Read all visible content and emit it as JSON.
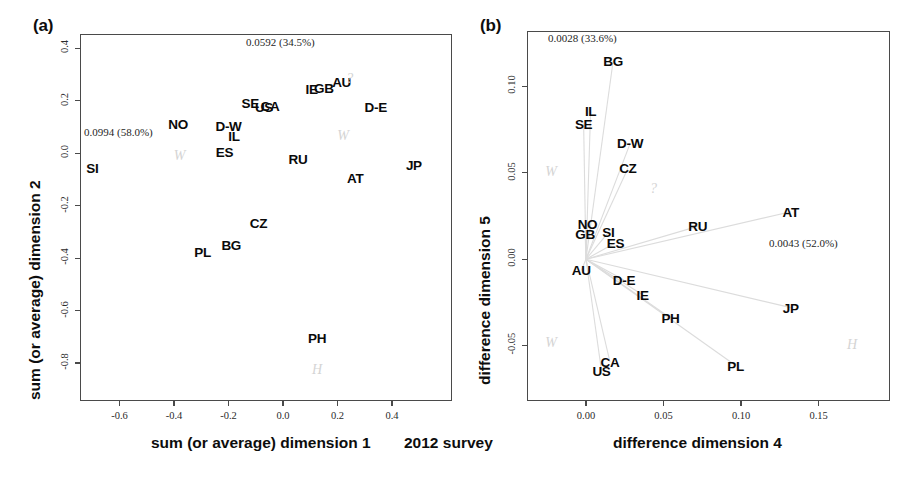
{
  "figure": {
    "survey_label": "2012 survey"
  },
  "panel_a": {
    "tag": "(a)",
    "xlabel": "sum (or average) dimension 1",
    "ylabel": "sum (or average) dimension 2",
    "inertia_x": "0.0994  (58.0%)",
    "inertia_y": "0.0592  (34.5%)",
    "xticks": [
      "-0.6",
      "-0.4",
      "-0.2",
      "0.0",
      "0.2",
      "0.4"
    ],
    "xtick_values": [
      -0.6,
      -0.4,
      -0.2,
      0.0,
      0.2,
      0.4
    ],
    "yticks": [
      "0.4",
      "0.2",
      "0.0",
      "-0.2",
      "-0.4",
      "-0.6",
      "-0.8"
    ],
    "ytick_values": [
      0.4,
      0.2,
      0.0,
      -0.2,
      -0.4,
      -0.6,
      -0.8
    ],
    "watermarks": [
      {
        "text": "W",
        "x": -0.38,
        "y": -0.01
      },
      {
        "text": "?",
        "x": 0.245,
        "y": 0.285
      },
      {
        "text": "W",
        "x": 0.22,
        "y": 0.065
      },
      {
        "text": "H",
        "x": 0.125,
        "y": -0.825
      }
    ]
  },
  "panel_b": {
    "tag": "(b)",
    "xlabel": "difference dimension 4",
    "ylabel": "difference dimension 5",
    "inertia_x": "0.0043  (52.0%)",
    "inertia_y": "0.0028  (33.6%)",
    "xticks": [
      "0.00",
      "0.05",
      "0.10",
      "0.15"
    ],
    "xtick_values": [
      0.0,
      0.05,
      0.1,
      0.15
    ],
    "yticks": [
      "0.10",
      "0.05",
      "0.00",
      "-0.05"
    ],
    "ytick_values": [
      0.1,
      0.05,
      0.0,
      -0.05
    ],
    "watermarks": [
      {
        "text": "W",
        "x": -0.0225,
        "y": 0.0505
      },
      {
        "text": "?",
        "x": 0.0435,
        "y": 0.0405
      },
      {
        "text": "W",
        "x": -0.0225,
        "y": -0.0485
      },
      {
        "text": "H",
        "x": 0.1715,
        "y": -0.0495
      }
    ]
  },
  "chart_data": [
    {
      "type": "scatter",
      "panel": "(a)",
      "title": "sum (or average) dimensions 1 and 2",
      "xlabel": "sum (or average) dimension 1",
      "ylabel": "sum (or average) dimension 2",
      "xlim": [
        -0.745,
        0.62
      ],
      "ylim": [
        -0.945,
        0.455
      ],
      "grid": false,
      "legend": "none",
      "axis_inertia": {
        "dim1_eigenvalue": 0.0994,
        "dim1_percent": 58.0,
        "dim2_eigenvalue": 0.0592,
        "dim2_percent": 34.5
      },
      "points": [
        {
          "label": "SI",
          "x": -0.7,
          "y": -0.055
        },
        {
          "label": "NO",
          "x": -0.385,
          "y": 0.11
        },
        {
          "label": "ES",
          "x": -0.215,
          "y": 0.005
        },
        {
          "label": "D-W",
          "x": -0.2,
          "y": 0.105
        },
        {
          "label": "IL",
          "x": -0.18,
          "y": 0.065
        },
        {
          "label": "SE",
          "x": -0.12,
          "y": 0.19
        },
        {
          "label": "US",
          "x": -0.07,
          "y": 0.175
        },
        {
          "label": "CA",
          "x": -0.048,
          "y": 0.18
        },
        {
          "label": "PL",
          "x": -0.295,
          "y": -0.375
        },
        {
          "label": "BG",
          "x": -0.19,
          "y": -0.35
        },
        {
          "label": "CZ",
          "x": -0.09,
          "y": -0.265
        },
        {
          "label": "RU",
          "x": 0.055,
          "y": -0.02
        },
        {
          "label": "IE",
          "x": 0.105,
          "y": 0.245
        },
        {
          "label": "GB",
          "x": 0.15,
          "y": 0.25
        },
        {
          "label": "AU",
          "x": 0.215,
          "y": 0.27
        },
        {
          "label": "D-E",
          "x": 0.34,
          "y": 0.175
        },
        {
          "label": "AT",
          "x": 0.265,
          "y": -0.095
        },
        {
          "label": "JP",
          "x": 0.48,
          "y": -0.045
        },
        {
          "label": "PH",
          "x": 0.125,
          "y": -0.705
        }
      ]
    },
    {
      "type": "scatter",
      "panel": "(b)",
      "title": "difference dimensions 4 and 5",
      "xlabel": "difference dimension 4",
      "ylabel": "difference dimension 5",
      "xlim": [
        -0.038,
        0.196
      ],
      "ylim": [
        -0.082,
        0.132
      ],
      "grid": false,
      "legend": "none",
      "origin_rays": true,
      "origin": [
        0.0,
        0.0
      ],
      "axis_inertia": {
        "dim4_eigenvalue": 0.0043,
        "dim4_percent": 52.0,
        "dim5_eigenvalue": 0.0028,
        "dim5_percent": 33.6
      },
      "points": [
        {
          "label": "BG",
          "x": 0.0175,
          "y": 0.1145
        },
        {
          "label": "IL",
          "x": 0.003,
          "y": 0.0855
        },
        {
          "label": "SE",
          "x": -0.0015,
          "y": 0.0785
        },
        {
          "label": "D-W",
          "x": 0.0285,
          "y": 0.067
        },
        {
          "label": "CZ",
          "x": 0.027,
          "y": 0.0525
        },
        {
          "label": "NO",
          "x": 0.001,
          "y": 0.0205
        },
        {
          "label": "GB",
          "x": -0.0005,
          "y": 0.0145
        },
        {
          "label": "SI",
          "x": 0.0145,
          "y": 0.0155
        },
        {
          "label": "ES",
          "x": 0.019,
          "y": 0.0095
        },
        {
          "label": "RU",
          "x": 0.072,
          "y": 0.019
        },
        {
          "label": "AT",
          "x": 0.132,
          "y": 0.0275
        },
        {
          "label": "AU",
          "x": -0.003,
          "y": -0.0065
        },
        {
          "label": "D-E",
          "x": 0.0245,
          "y": -0.012
        },
        {
          "label": "IE",
          "x": 0.0365,
          "y": -0.0205
        },
        {
          "label": "JP",
          "x": 0.132,
          "y": -0.028
        },
        {
          "label": "PH",
          "x": 0.0545,
          "y": -0.034
        },
        {
          "label": "PL",
          "x": 0.0965,
          "y": -0.0615
        },
        {
          "label": "US",
          "x": 0.01,
          "y": -0.0645
        },
        {
          "label": "CA",
          "x": 0.0155,
          "y": -0.0595
        }
      ]
    }
  ]
}
